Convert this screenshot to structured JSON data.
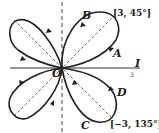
{
  "figure": {
    "labels": {
      "origin": "O",
      "axis": "I",
      "axis_sub": "3",
      "point_a": "A",
      "point_b": "B",
      "point_c": "C",
      "point_d": "D",
      "coord_top": "[3, 45°]",
      "coord_bottom": "[−3, 135°]"
    },
    "colors": {
      "curve": "#222222",
      "axis": "#333333"
    }
  }
}
